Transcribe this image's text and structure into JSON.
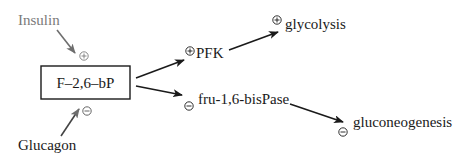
{
  "diagram": {
    "center_node": {
      "label": "F–2,6–bP"
    },
    "regulators": [
      {
        "label": "Insulin",
        "effect": "+",
        "color": "#7a7a7a"
      },
      {
        "label": "Glucagon",
        "effect": "−",
        "color": "#1a1a1a"
      }
    ],
    "targets": [
      {
        "label": "PFK",
        "effect": "+"
      },
      {
        "label": "fru-1,6-bisPase",
        "effect": "−"
      }
    ],
    "outcomes": [
      {
        "label": "glycolysis",
        "effect": "+"
      },
      {
        "label": "gluconeogenesis",
        "effect": "−"
      }
    ],
    "colors": {
      "arrow": "#1a1a1a",
      "arrow_gray": "#6e6e6e",
      "text": "#1a1a1a",
      "text_gray": "#7a7a7a"
    }
  }
}
